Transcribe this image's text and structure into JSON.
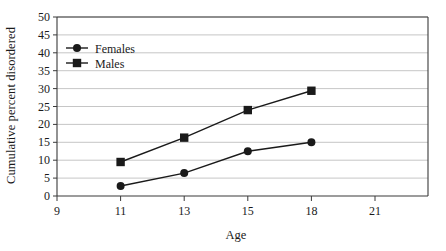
{
  "chart_data": {
    "type": "line",
    "title": "",
    "xlabel": "Age",
    "ylabel": "Cumulative percent disordered",
    "categories": [
      "9",
      "11",
      "13",
      "15",
      "18",
      "21"
    ],
    "xtick_labels": [
      "9",
      "11",
      "13",
      "15",
      "18",
      "21"
    ],
    "ytick_labels": [
      "0",
      "5",
      "10",
      "15",
      "20",
      "25",
      "30",
      "35",
      "40",
      "45",
      "50"
    ],
    "ylim": [
      0,
      50
    ],
    "ytick_step": 5,
    "grid": "horizontal",
    "legend_position": "upper-left-inside",
    "series": [
      {
        "name": "Females",
        "marker": "circle",
        "color": "#1a1a1a",
        "x": [
          "11",
          "13",
          "15",
          "18"
        ],
        "values": [
          2.8,
          6.4,
          12.5,
          15.0
        ]
      },
      {
        "name": "Males",
        "marker": "square",
        "color": "#1a1a1a",
        "x": [
          "11",
          "13",
          "15",
          "18"
        ],
        "values": [
          9.5,
          16.3,
          24.0,
          29.4
        ]
      }
    ],
    "axis_color": "#3a3a3a",
    "grid_color": "#b8b8b8",
    "background": "#ffffff"
  }
}
